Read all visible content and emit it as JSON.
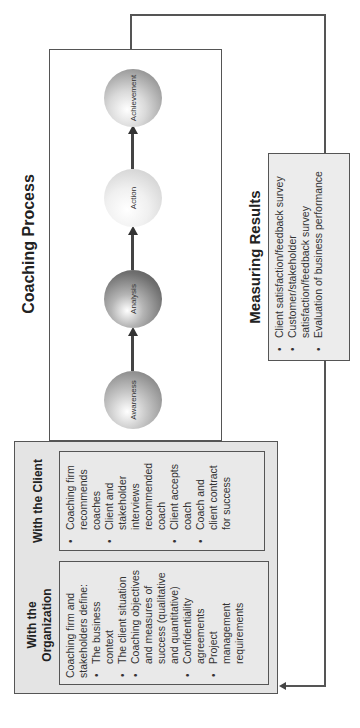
{
  "coaching_process": {
    "title": "Coaching Process",
    "stages": [
      {
        "label": "Awareness",
        "color": "#8f8f8f"
      },
      {
        "label": "Analysis",
        "color": "#6f6f6f"
      },
      {
        "label": "Action",
        "color": "#d8d8d8"
      },
      {
        "label": "Achievement",
        "color": "#9c9c9c"
      }
    ]
  },
  "measuring_results": {
    "title": "Measuring Results",
    "items": [
      "Client satisfaction/feedback survey",
      "Customer/stakeholder satisfaction/feedback survey",
      "Evaluation of business performance"
    ]
  },
  "with_organization": {
    "title": "With the Organization",
    "intro": "Coaching firm and stakeholders define:",
    "items": [
      "The business context",
      "The client situation",
      "Coaching objectives and measures of success (qualitative and quantitative)",
      "Confidentiality agreements",
      "Project management requirements"
    ]
  },
  "with_client": {
    "title": "With the Client",
    "items": [
      "Coaching firm recommends coaches",
      "Client and stakeholder interviews recommended coach",
      "Client accepts coach",
      "Coach and client contract for success"
    ]
  }
}
